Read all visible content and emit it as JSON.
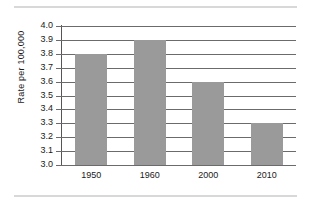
{
  "chart_data": {
    "type": "bar",
    "title": "",
    "subtitle": "",
    "xlabel": "",
    "ylabel": "Rate per 100,000",
    "categories": [
      "1950",
      "1960",
      "2000",
      "2010"
    ],
    "values": [
      3.8,
      3.9,
      3.6,
      3.3
    ],
    "series": [
      {
        "name": "Rate per 100,000",
        "values": [
          3.8,
          3.9,
          3.6,
          3.3
        ]
      }
    ],
    "ylim": [
      3.0,
      4.0
    ],
    "ytick_step": 0.1,
    "ytick_labels": [
      "3.0",
      "3.1",
      "3.2",
      "3.3",
      "3.4",
      "3.5",
      "3.6",
      "3.7",
      "3.8",
      "3.9",
      "4.0"
    ],
    "ytick_values": [
      3.0,
      3.1,
      3.2,
      3.3,
      3.4,
      3.5,
      3.6,
      3.7,
      3.8,
      3.9,
      4.0
    ],
    "grid": true,
    "grid_axis": "y",
    "legend": false,
    "legend_position": "none",
    "bar_color": "#9a9a9a",
    "grid_color": "#6b6b6b",
    "axis_color": "#555555",
    "text_color": "#1a1a1a",
    "rule_color": "#d8d8d8",
    "background": "#ffffff",
    "annotations": []
  }
}
